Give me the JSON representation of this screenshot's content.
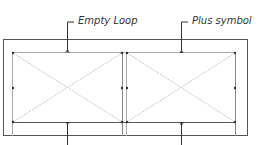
{
  "diagram": {
    "labels": {
      "top_left": "Empty Loop",
      "top_right": "Plus symbol"
    },
    "colors": {
      "frame": "#555555",
      "panel": "#999999",
      "diagonal": "#b0b0b0",
      "label": "#333333"
    },
    "panels": [
      {
        "name": "left-panel",
        "x": 13,
        "y": 53,
        "w": 109,
        "h": 69
      },
      {
        "name": "right-panel",
        "x": 127,
        "y": 53,
        "w": 108,
        "h": 69
      }
    ]
  }
}
